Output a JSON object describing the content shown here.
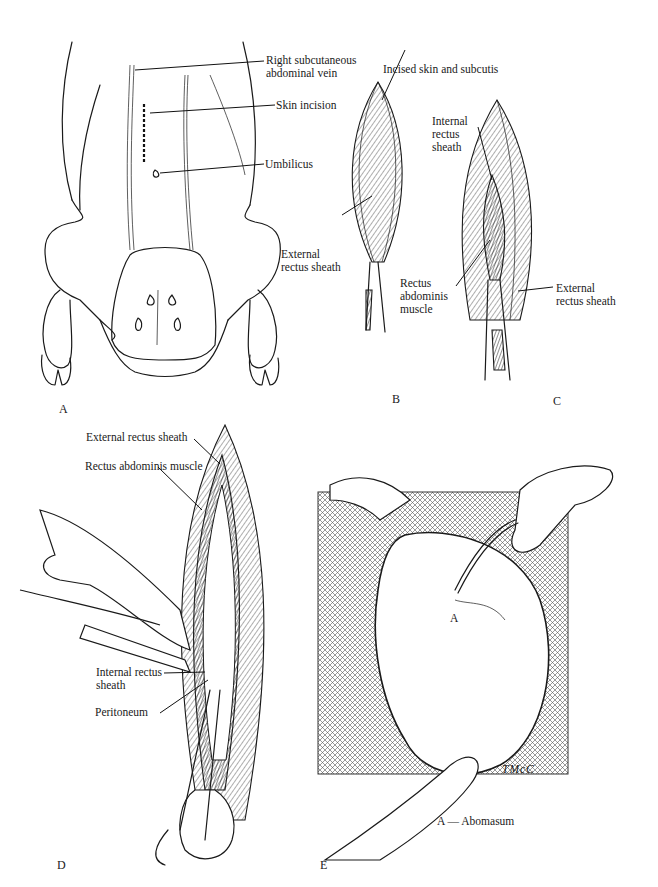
{
  "figure": {
    "panels": [
      {
        "id": "A",
        "letter": "A",
        "labels": {
          "vein": "Right subcutaneous\nabdominal vein",
          "incision": "Skin incision",
          "umbilicus": "Umbilicus"
        }
      },
      {
        "id": "B",
        "letter": "B",
        "labels": {
          "incised": "Incised skin and subcutis",
          "external": "External\nrectus sheath"
        }
      },
      {
        "id": "C",
        "letter": "C",
        "labels": {
          "internal": "Internal\nrectus\nsheath",
          "rectus": "Rectus\nabdominis\nmuscle",
          "external": "External\nrectus sheath"
        }
      },
      {
        "id": "D",
        "letter": "D",
        "labels": {
          "external": "External rectus sheath",
          "rectus": "Rectus abdominis muscle",
          "internal": "Internal rectus\nsheath",
          "peritoneum": "Peritoneum"
        }
      },
      {
        "id": "E",
        "letter": "E",
        "labels": {
          "organ_marker": "A",
          "signature": "TMcC",
          "legend": "A — Abomasum"
        }
      }
    ]
  },
  "colors": {
    "ink": "#1a1a1a",
    "paper": "#ffffff"
  }
}
